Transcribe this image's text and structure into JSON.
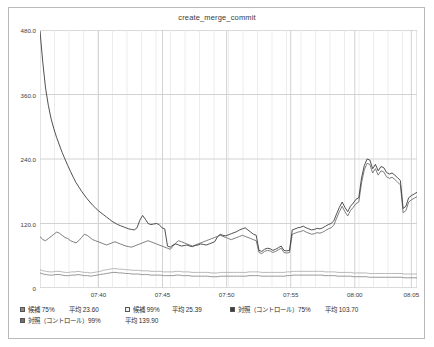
{
  "chart_data": {
    "type": "line",
    "title": "create_merge_commit",
    "xlabel": "",
    "ylabel": "",
    "grid": true,
    "legend_position": "bottom",
    "ylim": [
      0,
      480
    ],
    "yticks": [
      "0",
      "120.0",
      "240.0",
      "360.0",
      "480.0"
    ],
    "ytick_values": [
      0,
      120,
      240,
      360,
      480
    ],
    "xticks": [
      "07:40",
      "07:45",
      "07:50",
      "07:55",
      "08:00",
      "08:05"
    ],
    "xtick_positions": [
      0.155,
      0.325,
      0.495,
      0.665,
      0.835,
      0.985
    ],
    "series": [
      {
        "name": "候補 75%",
        "average": "23.60",
        "average_value": 23.6,
        "color": "#8c8c8c",
        "marker": "filled-square",
        "values": [
          28,
          26,
          25,
          24,
          24,
          25,
          25,
          24,
          23,
          23,
          24,
          24,
          25,
          24,
          23,
          23,
          22,
          23,
          24,
          25,
          26,
          27,
          28,
          29,
          29,
          28,
          28,
          27,
          27,
          26,
          26,
          26,
          25,
          25,
          25,
          24,
          24,
          24,
          24,
          23,
          23,
          23,
          23,
          24,
          24,
          23,
          23,
          23,
          22,
          22,
          22,
          22,
          22,
          22,
          21,
          21,
          21,
          22,
          22,
          22,
          22,
          22,
          22,
          22,
          22,
          22,
          23,
          23,
          23,
          23,
          22,
          22,
          22,
          22,
          22,
          22,
          22,
          22,
          23,
          23,
          24,
          24,
          24,
          24,
          24,
          24,
          24,
          24,
          24,
          24,
          23,
          23,
          23,
          23,
          22,
          22,
          22,
          22,
          22,
          21,
          21,
          21,
          21,
          21,
          20,
          20,
          20,
          20,
          20,
          20,
          20,
          20,
          20,
          20,
          20,
          19,
          19,
          19,
          19,
          19
        ]
      },
      {
        "name": "候補 99%",
        "average": "25.39",
        "average_value": 25.39,
        "color": "#b0b0b0",
        "marker": "open-square",
        "values": [
          34,
          32,
          31,
          30,
          30,
          31,
          31,
          30,
          29,
          29,
          30,
          30,
          31,
          30,
          29,
          29,
          28,
          29,
          30,
          31,
          33,
          34,
          35,
          36,
          36,
          35,
          35,
          34,
          34,
          33,
          33,
          33,
          32,
          32,
          32,
          31,
          31,
          31,
          31,
          30,
          30,
          30,
          30,
          31,
          31,
          30,
          30,
          30,
          29,
          29,
          29,
          29,
          29,
          29,
          28,
          28,
          28,
          29,
          29,
          29,
          29,
          29,
          29,
          29,
          29,
          29,
          30,
          30,
          30,
          30,
          29,
          29,
          29,
          29,
          29,
          29,
          29,
          29,
          30,
          30,
          31,
          31,
          31,
          31,
          31,
          31,
          31,
          31,
          31,
          31,
          30,
          30,
          30,
          30,
          29,
          29,
          29,
          29,
          29,
          28,
          28,
          28,
          28,
          28,
          27,
          27,
          27,
          27,
          27,
          27,
          27,
          27,
          27,
          27,
          27,
          26,
          26,
          26,
          26,
          26
        ]
      },
      {
        "name": "対照（コントロール）75%",
        "average": "103.70",
        "average_value": 103.7,
        "color": "#3d3d3d",
        "marker": "filled-square",
        "values": [
          478,
          420,
          372,
          340,
          315,
          296,
          280,
          266,
          252,
          240,
          228,
          217,
          206,
          196,
          188,
          180,
          173,
          166,
          160,
          154,
          149,
          144,
          140,
          136,
          132,
          128,
          124,
          121,
          118,
          116,
          114,
          112,
          110,
          109,
          108,
          112,
          126,
          135,
          128,
          120,
          118,
          119,
          120,
          118,
          112,
          110,
          78,
          76,
          80,
          82,
          80,
          78,
          79,
          80,
          78,
          77,
          79,
          80,
          82,
          81,
          80,
          82,
          84,
          86,
          95,
          100,
          98,
          97,
          99,
          101,
          103,
          105,
          108,
          110,
          112,
          108,
          104,
          100,
          98,
          70,
          68,
          72,
          74,
          73,
          70,
          72,
          75,
          78,
          70,
          69,
          70,
          108,
          110,
          112,
          113,
          115,
          112,
          110,
          108,
          109,
          111,
          110,
          112,
          115,
          118,
          120,
          125,
          138,
          150,
          160,
          150,
          142,
          152,
          158,
          165,
          168,
          205,
          228,
          240,
          238,
          222,
          230,
          218,
          226,
          224,
          215,
          212,
          214,
          210,
          205,
          200,
          148,
          152,
          168,
          172,
          175,
          178
        ]
      },
      {
        "name": "対照（コントロール）99%",
        "average": "139.90",
        "average_value": 139.9,
        "color": "#6f6f6f",
        "marker": "filled-square",
        "values": [
          96,
          90,
          88,
          92,
          96,
          100,
          104,
          102,
          98,
          94,
          92,
          88,
          86,
          84,
          88,
          94,
          100,
          98,
          94,
          90,
          88,
          86,
          84,
          82,
          80,
          82,
          84,
          86,
          84,
          82,
          80,
          78,
          77,
          76,
          78,
          80,
          82,
          84,
          86,
          88,
          86,
          84,
          82,
          80,
          78,
          76,
          74,
          72,
          78,
          84,
          88,
          86,
          84,
          82,
          80,
          78,
          80,
          82,
          84,
          86,
          88,
          90,
          92,
          94,
          96,
          98,
          96,
          94,
          92,
          90,
          92,
          94,
          96,
          98,
          96,
          94,
          92,
          90,
          88,
          66,
          64,
          68,
          70,
          69,
          66,
          68,
          71,
          74,
          66,
          65,
          66,
          100,
          102,
          104,
          105,
          107,
          104,
          102,
          100,
          101,
          103,
          102,
          104,
          107,
          110,
          112,
          117,
          130,
          142,
          152,
          142,
          134,
          144,
          150,
          157,
          160,
          196,
          220,
          232,
          230,
          214,
          222,
          210,
          218,
          216,
          207,
          204,
          206,
          202,
          197,
          192,
          140,
          144,
          160,
          164,
          167,
          170
        ]
      }
    ]
  }
}
